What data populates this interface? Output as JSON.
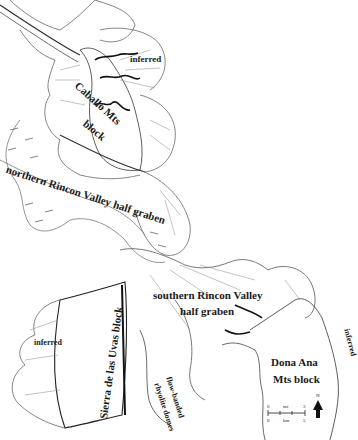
{
  "labels": {
    "caballo_line1": "Caballo Mts",
    "caballo_line2": "block",
    "inferred_top": "inferred",
    "northern_rincon": "northern Rincon Valley half graben",
    "southern_rincon_line1": "southern Rincon Valley",
    "southern_rincon_line2": "half graben",
    "sierra_uvas": "Sierra de las Uvas block",
    "inferred_left": "inferred",
    "flow_banded_line1": "flow-banded",
    "flow_banded_line2": "rhyolite domes",
    "dona_ana_line1": "Dona Ana",
    "dona_ana_line2": "Mts block",
    "inferred_right": "inferred"
  },
  "scale_bar": {
    "mi_label": "mi",
    "km_label": "km",
    "mi_start": "0",
    "mi_end": "3",
    "km_start": "0",
    "km_end": "5"
  },
  "north_arrow": {
    "label": "N"
  },
  "colors": {
    "ink": "#1a1a1a",
    "line": "#555555",
    "paper": "#ffffff"
  }
}
